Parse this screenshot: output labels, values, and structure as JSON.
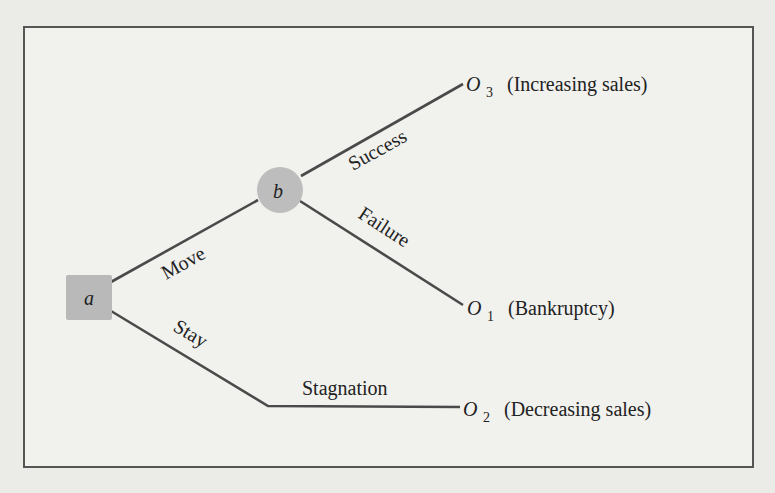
{
  "diagram": {
    "type": "decision-tree",
    "nodes": {
      "decision": {
        "label": "a",
        "shape": "square",
        "color": "#b9b9b9"
      },
      "chance": {
        "label": "b",
        "shape": "circle",
        "color": "#bdbdbd"
      }
    },
    "branches": {
      "move": "Move",
      "stay": "Stay",
      "success": "Success",
      "failure": "Failure",
      "stagnation": "Stagnation"
    },
    "outcomes": {
      "o3": {
        "symbol": "O",
        "subscript": "3",
        "description": "(Increasing sales)"
      },
      "o1": {
        "symbol": "O",
        "subscript": "1",
        "description": "(Bankruptcy)"
      },
      "o2": {
        "symbol": "O",
        "subscript": "2",
        "description": "(Decreasing sales)"
      }
    },
    "colors": {
      "background": "#ebebe8",
      "frame": "#555555",
      "edges": "#4a4a4a"
    }
  }
}
